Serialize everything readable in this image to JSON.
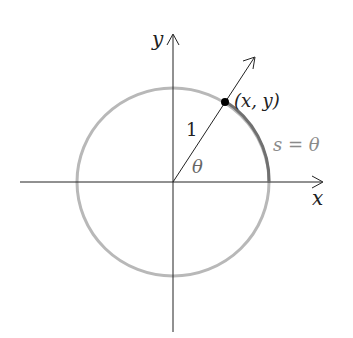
{
  "diagram": {
    "axes": {
      "x_label": "x",
      "y_label": "y"
    },
    "radius_label": "1",
    "angle_label": "θ",
    "point_label": "(x, y)",
    "arc_label": "s = θ",
    "colors": {
      "axis": "#222222",
      "circle": "#b8b8b8",
      "arc": "#707070",
      "point": "#000000",
      "arc_label": "#8a8a8a"
    }
  }
}
